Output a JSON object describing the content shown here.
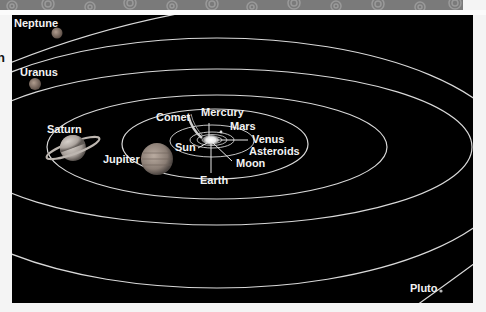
{
  "diagram": {
    "edge_text": "n",
    "colors": {
      "background": "#000000",
      "orbit": "#d9d9d9",
      "label": "#f2f2f2",
      "banner": "#7a7a7a"
    },
    "labels": {
      "neptune": "Neptune",
      "uranus": "Uranus",
      "saturn": "Saturn",
      "jupiter": "Jupiter",
      "comet": "Comet",
      "mercury": "Mercury",
      "mars": "Mars",
      "venus": "Venus",
      "asteroids": "Asteroids",
      "sun": "Sun",
      "moon": "Moon",
      "earth": "Earth",
      "pluto": "Pluto"
    }
  }
}
